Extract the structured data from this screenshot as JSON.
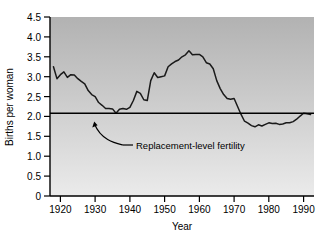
{
  "chart_data": {
    "type": "line",
    "title": "",
    "subtitle": "",
    "xlabel": "Year",
    "ylabel": "Births per woman",
    "xlim": [
      1917,
      1993
    ],
    "ylim": [
      0,
      4.5
    ],
    "grid": false,
    "legend": "none",
    "x_ticks": [
      1920,
      1930,
      1940,
      1950,
      1960,
      1970,
      1980,
      1990
    ],
    "x_tick_labels": [
      "1920",
      "1930",
      "1940",
      "1950",
      "1960",
      "1970",
      "1980",
      "1990"
    ],
    "y_ticks": [
      0,
      0.5,
      1.0,
      1.5,
      2.0,
      2.5,
      3.0,
      3.5,
      4.0,
      4.5
    ],
    "y_tick_labels": [
      "0",
      "0.5",
      "1.0",
      "1.5",
      "2.0",
      "2.5",
      "3.0",
      "3.5",
      "4.0",
      "4.5"
    ],
    "series": [
      {
        "name": "Total fertility rate",
        "color": "#1a1a1a",
        "x": [
          1918,
          1919,
          1920,
          1921,
          1922,
          1923,
          1924,
          1925,
          1926,
          1927,
          1928,
          1929,
          1930,
          1931,
          1932,
          1933,
          1934,
          1935,
          1936,
          1937,
          1938,
          1939,
          1940,
          1941,
          1942,
          1943,
          1944,
          1945,
          1946,
          1947,
          1948,
          1949,
          1950,
          1951,
          1952,
          1953,
          1954,
          1955,
          1956,
          1957,
          1958,
          1959,
          1960,
          1961,
          1962,
          1963,
          1964,
          1965,
          1966,
          1967,
          1968,
          1969,
          1970,
          1971,
          1972,
          1973,
          1974,
          1975,
          1976,
          1977,
          1978,
          1979,
          1980,
          1981,
          1982,
          1983,
          1984,
          1985,
          1986,
          1987,
          1988,
          1989,
          1990,
          1991,
          1992
        ],
        "y": [
          3.25,
          2.95,
          3.05,
          3.12,
          2.98,
          3.05,
          3.04,
          2.95,
          2.88,
          2.82,
          2.65,
          2.55,
          2.5,
          2.35,
          2.28,
          2.2,
          2.2,
          2.19,
          2.08,
          2.18,
          2.2,
          2.18,
          2.23,
          2.4,
          2.63,
          2.58,
          2.42,
          2.4,
          2.9,
          3.1,
          2.98,
          3.0,
          3.02,
          3.25,
          3.32,
          3.38,
          3.42,
          3.5,
          3.55,
          3.65,
          3.55,
          3.56,
          3.56,
          3.5,
          3.35,
          3.32,
          3.2,
          2.9,
          2.7,
          2.55,
          2.45,
          2.43,
          2.45,
          2.25,
          2.05,
          1.88,
          1.83,
          1.77,
          1.74,
          1.79,
          1.76,
          1.8,
          1.84,
          1.82,
          1.83,
          1.8,
          1.81,
          1.84,
          1.84,
          1.87,
          1.93,
          2.01,
          2.08,
          2.07,
          2.05
        ]
      }
    ],
    "reference_line": {
      "name": "Replacement-level fertility",
      "value": 2.08,
      "label": "Replacement-level fertility",
      "color": "#000000"
    },
    "colors": {
      "plot_bg_top": "#b5b5b5",
      "plot_bg_bottom": "#e8e8e8",
      "frame": "#000000",
      "line": "#1a1a1a",
      "page_bg": "#ffffff"
    }
  }
}
